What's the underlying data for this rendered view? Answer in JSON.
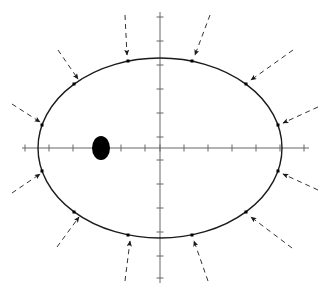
{
  "figure": {
    "title": "",
    "background_color": "#ffffff",
    "width": 329,
    "height": 293,
    "caption": ""
  },
  "chart_data": {
    "type": "scatter",
    "title": "",
    "subtitle": "",
    "xlabel": "",
    "ylabel": "",
    "grid": false,
    "legend": null,
    "legend_position": "none",
    "axes": {
      "x_axis": {
        "y_pixel": 148,
        "x_start_pixel": 22,
        "x_end_pixel": 309,
        "tick_count": 13,
        "tick_spacing_pixels": 24,
        "tick_length_pixels": 7,
        "color": "#666666",
        "tick_positions_pixels": [
          25,
          49,
          73,
          97,
          121,
          145,
          160,
          184,
          208,
          232,
          256,
          280,
          304
        ]
      },
      "y_axis": {
        "x_pixel": 160,
        "y_start_pixel": 12,
        "y_end_pixel": 283,
        "tick_count": 12,
        "tick_spacing_pixels": 24,
        "tick_length_pixels": 7,
        "color": "#666666",
        "tick_positions_pixels": [
          17,
          41,
          65,
          89,
          113,
          137,
          160,
          184,
          208,
          232,
          256,
          278
        ]
      }
    },
    "ellipse": {
      "center_x_pixel": 160,
      "center_y_pixel": 148,
      "semi_major_pixels": 122,
      "semi_minor_pixels": 90,
      "stroke_color": "#1a1a1a",
      "stroke_width": 1.4,
      "fill": "none"
    },
    "focus_marker": {
      "label": "focus",
      "center_x_pixel": 101,
      "center_y_pixel": 148,
      "radius_x_pixels": 9,
      "radius_y_pixels": 12,
      "fill_color": "#000000"
    },
    "marked_points": [
      {
        "id": 1,
        "angle_deg": 15,
        "x_pixel": 278,
        "y_pixel": 125,
        "marker": "square",
        "size": 3
      },
      {
        "id": 2,
        "angle_deg": 45,
        "x_pixel": 246,
        "y_pixel": 84,
        "marker": "square",
        "size": 3
      },
      {
        "id": 3,
        "angle_deg": 75,
        "x_pixel": 192,
        "y_pixel": 61,
        "marker": "square",
        "size": 3
      },
      {
        "id": 4,
        "angle_deg": 105,
        "x_pixel": 128,
        "y_pixel": 61,
        "marker": "square",
        "size": 3
      },
      {
        "id": 5,
        "angle_deg": 135,
        "x_pixel": 74,
        "y_pixel": 84,
        "marker": "square",
        "size": 3
      },
      {
        "id": 6,
        "angle_deg": 165,
        "x_pixel": 42,
        "y_pixel": 125,
        "marker": "square",
        "size": 3
      },
      {
        "id": 7,
        "angle_deg": 195,
        "x_pixel": 42,
        "y_pixel": 171,
        "marker": "square",
        "size": 3
      },
      {
        "id": 8,
        "angle_deg": 225,
        "x_pixel": 74,
        "y_pixel": 212,
        "marker": "square",
        "size": 3
      },
      {
        "id": 9,
        "angle_deg": 255,
        "x_pixel": 128,
        "y_pixel": 235,
        "marker": "square",
        "size": 3
      },
      {
        "id": 10,
        "angle_deg": 285,
        "x_pixel": 192,
        "y_pixel": 235,
        "marker": "square",
        "size": 3
      },
      {
        "id": 11,
        "angle_deg": 315,
        "x_pixel": 246,
        "y_pixel": 212,
        "marker": "square",
        "size": 3
      },
      {
        "id": 12,
        "angle_deg": 345,
        "x_pixel": 278,
        "y_pixel": 171,
        "marker": "square",
        "size": 3
      }
    ],
    "arrows": [
      {
        "id": 1,
        "from_x": 318,
        "from_y": 107,
        "to_x": 283,
        "to_y": 123,
        "style": "dashed",
        "color": "#333333"
      },
      {
        "id": 2,
        "from_x": 293,
        "from_y": 50,
        "to_x": 251,
        "to_y": 80,
        "style": "dashed",
        "color": "#333333"
      },
      {
        "id": 3,
        "from_x": 210,
        "from_y": 15,
        "to_x": 195,
        "to_y": 55,
        "style": "dashed",
        "color": "#333333"
      },
      {
        "id": 4,
        "from_x": 125,
        "from_y": 15,
        "to_x": 127,
        "to_y": 55,
        "style": "dashed",
        "color": "#333333"
      },
      {
        "id": 5,
        "from_x": 58,
        "from_y": 50,
        "to_x": 78,
        "to_y": 79,
        "style": "dashed",
        "color": "#333333"
      },
      {
        "id": 6,
        "from_x": 12,
        "from_y": 104,
        "to_x": 40,
        "to_y": 122,
        "style": "dashed",
        "color": "#333333"
      },
      {
        "id": 7,
        "from_x": 12,
        "from_y": 193,
        "to_x": 40,
        "to_y": 174,
        "style": "dashed",
        "color": "#333333"
      },
      {
        "id": 8,
        "from_x": 57,
        "from_y": 247,
        "to_x": 79,
        "to_y": 217,
        "style": "dashed",
        "color": "#333333"
      },
      {
        "id": 9,
        "from_x": 125,
        "from_y": 281,
        "to_x": 130,
        "to_y": 241,
        "style": "dashed",
        "color": "#333333"
      },
      {
        "id": 10,
        "from_x": 208,
        "from_y": 281,
        "to_x": 194,
        "to_y": 241,
        "style": "dashed",
        "color": "#333333"
      },
      {
        "id": 11,
        "from_x": 292,
        "from_y": 248,
        "to_x": 251,
        "to_y": 217,
        "style": "dashed",
        "color": "#333333"
      },
      {
        "id": 12,
        "from_x": 318,
        "from_y": 190,
        "to_x": 283,
        "to_y": 174,
        "style": "dashed",
        "color": "#333333"
      }
    ],
    "colors": {
      "ellipse_stroke": "#1a1a1a",
      "axis": "#666666",
      "arrow": "#333333",
      "focus_fill": "#000000",
      "point_fill": "#000000"
    }
  }
}
